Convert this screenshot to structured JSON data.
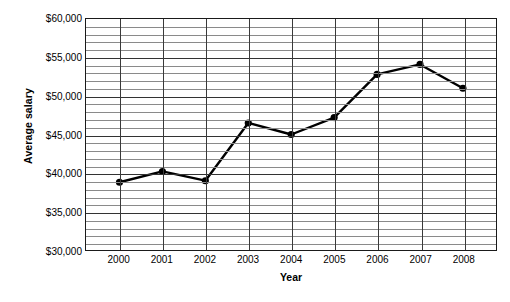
{
  "chart_data": {
    "type": "line",
    "title": "",
    "xlabel": "Year",
    "ylabel": "Average salary",
    "categories": [
      "2000",
      "2001",
      "2002",
      "2003",
      "2004",
      "2005",
      "2006",
      "2007",
      "2008"
    ],
    "values": [
      38800,
      40200,
      39000,
      46500,
      45000,
      47200,
      52800,
      54100,
      51000
    ],
    "series": [
      {
        "name": "Average salary",
        "values": [
          38800,
          40200,
          39000,
          46500,
          45000,
          47200,
          52800,
          54100,
          51000
        ]
      }
    ],
    "ylim": [
      30000,
      60000
    ],
    "y_major_step": 5000,
    "y_minor_step": 1000,
    "y_tick_labels": [
      "$60,000",
      "$55,000",
      "$50,000",
      "$45,000",
      "$40,000",
      "$35,000",
      "$30,000"
    ],
    "y_tick_values": [
      60000,
      55000,
      50000,
      45000,
      40000,
      35000,
      30000
    ],
    "grid": true,
    "grid_horizontal": true,
    "grid_vertical": true,
    "legend": false,
    "legend_position": "none",
    "marker": "filled-circle",
    "line_color": "#000000",
    "marker_color": "#000000",
    "background_color": "#ffffff",
    "plot_border_color": "#1a1a1a",
    "gridline_minor_color": "#8a8a8a",
    "gridline_major_color": "#333333"
  }
}
